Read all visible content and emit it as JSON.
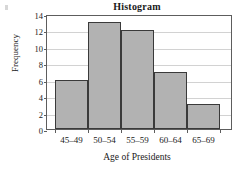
{
  "chart_data": {
    "type": "bar",
    "title": "Histogram",
    "xlabel": "Age of Presidents",
    "ylabel": "Frequency",
    "categories": [
      "45–49",
      "50–54",
      "55–59",
      "60–64",
      "65–69"
    ],
    "values": [
      6,
      13,
      12,
      7,
      3
    ],
    "ylim": [
      0,
      14
    ],
    "yticks": [
      0,
      2,
      4,
      6,
      8,
      10,
      12,
      14
    ],
    "ytick_labels": [
      "0",
      "2",
      "4",
      "6",
      "8",
      "10",
      "12",
      "14"
    ],
    "grid": "horizontal",
    "legend": "none",
    "bar_fill_color": "#b2b2b2",
    "bar_edge_color": "#3a3a3a",
    "gridline_color": "#d2d2d2",
    "frame_color": "#5d5d5d"
  }
}
